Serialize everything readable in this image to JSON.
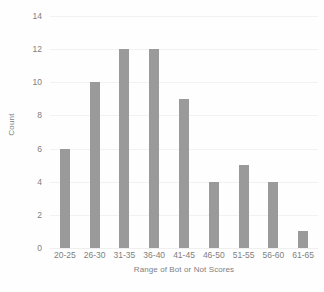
{
  "chart_data": {
    "type": "bar",
    "title": "",
    "subtitle": "",
    "xlabel": "Range of Bot or Not Scores",
    "ylabel": "Count",
    "categories": [
      "20-25",
      "26-30",
      "31-35",
      "36-40",
      "41-45",
      "46-50",
      "51-55",
      "56-60",
      "61-65"
    ],
    "values": [
      6,
      10,
      12,
      12,
      9,
      4,
      5,
      4,
      1
    ],
    "ylim": [
      0,
      14
    ],
    "y_ticks": [
      0,
      2,
      4,
      6,
      8,
      10,
      12,
      14
    ],
    "y_tick_labels": [
      "0",
      "2",
      "4",
      "6",
      "8",
      "10",
      "12",
      "14"
    ],
    "grid": true,
    "grid_axis": "y",
    "legend": false,
    "legend_position": "none",
    "colors": {
      "bar": "#9a9a9a",
      "gridline": "#f2f2f2",
      "tick_label": "#808080",
      "axis_title": "#7f7f7f",
      "background": "#fefefe"
    }
  }
}
